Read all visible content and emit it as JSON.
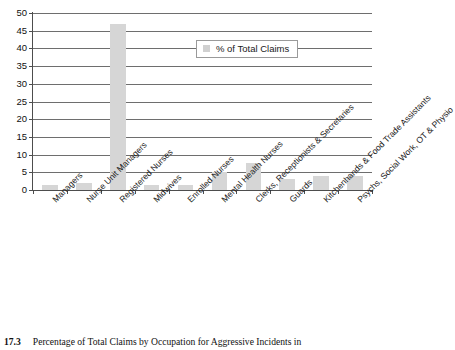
{
  "chart_data": {
    "type": "bar",
    "title": "",
    "xlabel": "",
    "ylabel": "",
    "ylim": [
      0,
      50
    ],
    "ytick_step": 5,
    "yticks": [
      0,
      5,
      10,
      15,
      20,
      25,
      30,
      35,
      40,
      45,
      50
    ],
    "grid": true,
    "legend_position": "inside-top-right",
    "legend": [
      "% of Total Claims"
    ],
    "bar_color": "#d6d6d6",
    "categories": [
      "Managers",
      "Nurse Unit Managers",
      "Registered Nurses",
      "Midwives",
      "Enrolled Nurses",
      "Mental Health Nurses",
      "Clerks, Receptionists & Secretaries",
      "Guards",
      "Kitchenhands & Food Trade Assistants",
      "Psychs, Social Work, OT & Physio"
    ],
    "series": [
      {
        "name": "% of Total Claims",
        "values": [
          1.5,
          2.0,
          47.0,
          1.5,
          1.5,
          5.0,
          7.7,
          3.2,
          4.1,
          4.1
        ]
      }
    ]
  },
  "legend": {
    "label": "% of Total Claims",
    "swatch_color": "#d0d0d0"
  },
  "caption": {
    "number": "17.3",
    "text": "Percentage of Total Claims by Occupation for Aggressive Incidents in"
  }
}
